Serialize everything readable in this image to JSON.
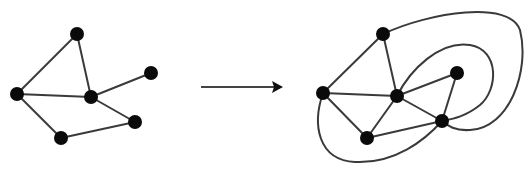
{
  "diagram": {
    "colors": {
      "edge": "#3a3a3a",
      "node": "#0a0a0a",
      "background": "#ffffff"
    },
    "node_radius": 7,
    "left_graph": {
      "nodes": [
        {
          "id": "A",
          "x": 77,
          "y": 34
        },
        {
          "id": "B",
          "x": 17,
          "y": 94
        },
        {
          "id": "C",
          "x": 91,
          "y": 97
        },
        {
          "id": "D",
          "x": 151,
          "y": 73
        },
        {
          "id": "E",
          "x": 135,
          "y": 122
        },
        {
          "id": "F",
          "x": 61,
          "y": 138
        }
      ],
      "edges": [
        [
          "A",
          "B"
        ],
        [
          "A",
          "C"
        ],
        [
          "B",
          "C"
        ],
        [
          "C",
          "D"
        ],
        [
          "C",
          "E"
        ],
        [
          "B",
          "F"
        ],
        [
          "F",
          "E"
        ]
      ]
    },
    "arrow": {
      "x1": 201,
      "y1": 87,
      "x2": 283,
      "y2": 87,
      "direction": "right"
    },
    "right_graph": {
      "nodes": [
        {
          "id": "A",
          "x": 383,
          "y": 34
        },
        {
          "id": "B",
          "x": 323,
          "y": 93
        },
        {
          "id": "C",
          "x": 397,
          "y": 96
        },
        {
          "id": "D",
          "x": 457,
          "y": 73
        },
        {
          "id": "E",
          "x": 442,
          "y": 121
        },
        {
          "id": "F",
          "x": 367,
          "y": 138
        }
      ],
      "edges": [
        [
          "A",
          "B"
        ],
        [
          "A",
          "C"
        ],
        [
          "B",
          "C"
        ],
        [
          "C",
          "D"
        ],
        [
          "C",
          "E"
        ],
        [
          "B",
          "F"
        ],
        [
          "F",
          "E"
        ],
        [
          "F",
          "C"
        ],
        [
          "D",
          "E"
        ]
      ],
      "curved_edges": [
        {
          "from": "A",
          "to": "E",
          "path": "M383,34 C430,12 510,0 520,30 C530,70 510,128 470,130 C455,131 448,126 442,121"
        },
        {
          "from": "C",
          "to": "E",
          "path": "M397,96 C410,70 440,40 470,45 C500,50 498,90 480,105 C465,117 452,119 442,121"
        },
        {
          "from": "B",
          "to": "E",
          "path": "M323,93 C312,125 318,160 355,162 C395,164 425,140 442,121"
        }
      ]
    }
  }
}
